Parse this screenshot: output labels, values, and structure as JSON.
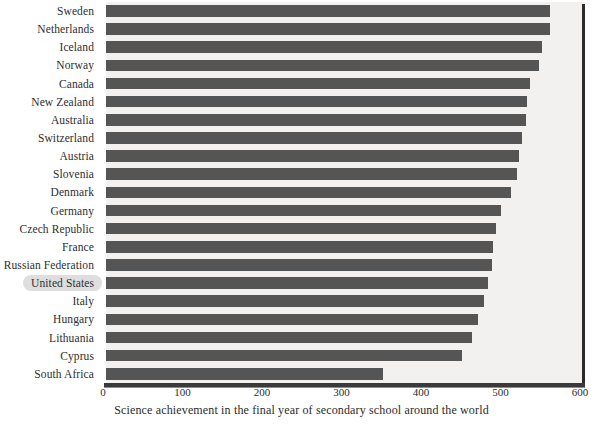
{
  "chart_data": {
    "type": "bar",
    "orientation": "horizontal",
    "title": "",
    "xlabel": "Science achievement in the final year of secondary school around the world",
    "ylabel": "",
    "xlim": [
      0,
      600
    ],
    "xticks": [
      0,
      100,
      200,
      300,
      400,
      500,
      600
    ],
    "xtick_labels": [
      "0",
      "100",
      "200",
      "300",
      "400",
      "500",
      "600"
    ],
    "grid": false,
    "legend": null,
    "bar_color": "#555555",
    "panel_color": "#f2f1ef",
    "highlight_color": "#dedede",
    "highlighted_category": "United States",
    "categories": [
      "Sweden",
      "Netherlands",
      "Iceland",
      "Norway",
      "Canada",
      "New Zealand",
      "Australia",
      "Switzerland",
      "Austria",
      "Slovenia",
      "Denmark",
      "Germany",
      "Czech Republic",
      "France",
      "Russian Federation",
      "United States",
      "Italy",
      "Hungary",
      "Lithuania",
      "Cyprus",
      "South Africa"
    ],
    "values": [
      559,
      559,
      549,
      545,
      533,
      529,
      528,
      523,
      520,
      517,
      509,
      497,
      491,
      487,
      485,
      480,
      475,
      468,
      461,
      448,
      349
    ]
  }
}
